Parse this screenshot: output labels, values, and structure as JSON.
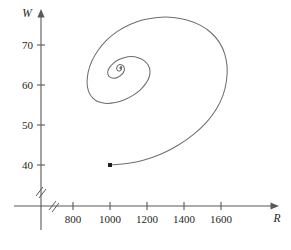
{
  "chart_data": {
    "type": "line",
    "title": "",
    "subtitle": "",
    "xlabel": "R",
    "ylabel": "W",
    "xlim": [
      700,
      1750
    ],
    "ylim": [
      36,
      78
    ],
    "grid": false,
    "legend": null,
    "axis_break": {
      "x_axis": true,
      "y_axis": true,
      "symbol": "double-slash"
    },
    "x_ticks": [
      800,
      1000,
      1200,
      1400,
      1600
    ],
    "x_tick_labels": [
      "800",
      "1000",
      "1200",
      "1400",
      "1600"
    ],
    "y_ticks": [
      40,
      50,
      60,
      70
    ],
    "y_tick_labels": [
      "40",
      "50",
      "60",
      "70"
    ],
    "annotations": [
      {
        "name": "start-point",
        "label": "",
        "x": 1000,
        "y": 40,
        "marker": "filled-square-dot"
      }
    ],
    "series": [
      {
        "name": "phase-trajectory",
        "description": "inward spiral trajectory",
        "color": "#6d6e71",
        "start": [
          1000,
          40
        ],
        "focus": [
          1063,
          64
        ],
        "points": [
          [
            1000,
            40.0
          ],
          [
            1080,
            40.3
          ],
          [
            1180,
            41.2
          ],
          [
            1280,
            42.8
          ],
          [
            1370,
            45.0
          ],
          [
            1450,
            47.6
          ],
          [
            1520,
            50.6
          ],
          [
            1575,
            54.0
          ],
          [
            1612,
            57.6
          ],
          [
            1630,
            61.2
          ],
          [
            1633,
            64.6
          ],
          [
            1620,
            67.8
          ],
          [
            1592,
            70.6
          ],
          [
            1548,
            73.0
          ],
          [
            1490,
            74.9
          ],
          [
            1420,
            76.2
          ],
          [
            1340,
            76.9
          ],
          [
            1258,
            76.9
          ],
          [
            1180,
            76.3
          ],
          [
            1108,
            75.1
          ],
          [
            1040,
            73.4
          ],
          [
            982,
            71.2
          ],
          [
            936,
            68.7
          ],
          [
            902,
            66.0
          ],
          [
            882,
            63.2
          ],
          [
            876,
            60.6
          ],
          [
            884,
            58.4
          ],
          [
            906,
            56.8
          ],
          [
            938,
            55.8
          ],
          [
            980,
            55.4
          ],
          [
            1028,
            55.6
          ],
          [
            1078,
            56.3
          ],
          [
            1124,
            57.4
          ],
          [
            1164,
            58.8
          ],
          [
            1194,
            60.4
          ],
          [
            1212,
            62.0
          ],
          [
            1216,
            63.6
          ],
          [
            1206,
            65.0
          ],
          [
            1184,
            66.1
          ],
          [
            1152,
            66.8
          ],
          [
            1116,
            67.1
          ],
          [
            1080,
            66.9
          ],
          [
            1046,
            66.3
          ],
          [
            1018,
            65.4
          ],
          [
            998,
            64.4
          ],
          [
            988,
            63.4
          ],
          [
            990,
            62.5
          ],
          [
            1002,
            61.9
          ],
          [
            1020,
            61.7
          ],
          [
            1040,
            61.9
          ],
          [
            1058,
            62.4
          ],
          [
            1072,
            63.1
          ],
          [
            1078,
            63.9
          ],
          [
            1074,
            64.6
          ],
          [
            1064,
            65.0
          ],
          [
            1052,
            65.1
          ],
          [
            1042,
            64.8
          ],
          [
            1036,
            64.3
          ],
          [
            1038,
            63.8
          ],
          [
            1046,
            63.5
          ],
          [
            1056,
            63.6
          ],
          [
            1062,
            64.0
          ],
          [
            1063,
            64.4
          ],
          [
            1060,
            64.6
          ],
          [
            1056,
            64.5
          ],
          [
            1054,
            64.2
          ],
          [
            1057,
            64.05
          ],
          [
            1060,
            64.15
          ],
          [
            1060.5,
            64.35
          ],
          [
            1059,
            64.4
          ],
          [
            1058,
            64.3
          ],
          [
            1059,
            64.22
          ]
        ]
      }
    ]
  }
}
